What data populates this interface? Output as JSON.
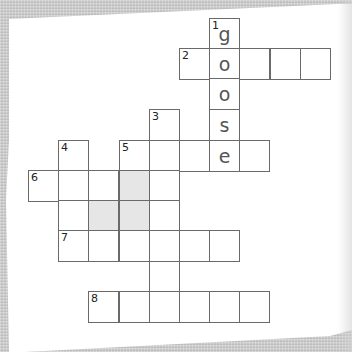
{
  "puzzle": {
    "type": "crossword",
    "cell_size_px": 30.2,
    "origin_px": {
      "x": 29,
      "y": 19
    },
    "colors": {
      "background": "#cfcfcf",
      "paper": "#ffffff",
      "grid_line": "#6a6a6a",
      "shaded_cell": "#e6e6e6",
      "letter": "#555555"
    },
    "cells": [
      {
        "row": 0,
        "col": 6,
        "number": "1",
        "letter": "g"
      },
      {
        "row": 1,
        "col": 5,
        "number": "2",
        "letter": ""
      },
      {
        "row": 1,
        "col": 6,
        "number": "",
        "letter": "o"
      },
      {
        "row": 1,
        "col": 7,
        "number": "",
        "letter": ""
      },
      {
        "row": 1,
        "col": 8,
        "number": "",
        "letter": ""
      },
      {
        "row": 1,
        "col": 9,
        "number": "",
        "letter": ""
      },
      {
        "row": 2,
        "col": 6,
        "number": "",
        "letter": "o"
      },
      {
        "row": 3,
        "col": 4,
        "number": "3",
        "letter": ""
      },
      {
        "row": 3,
        "col": 6,
        "number": "",
        "letter": "s"
      },
      {
        "row": 4,
        "col": 1,
        "number": "4",
        "letter": ""
      },
      {
        "row": 4,
        "col": 3,
        "number": "5",
        "letter": ""
      },
      {
        "row": 4,
        "col": 4,
        "number": "",
        "letter": ""
      },
      {
        "row": 4,
        "col": 5,
        "number": "",
        "letter": ""
      },
      {
        "row": 4,
        "col": 6,
        "number": "",
        "letter": "e"
      },
      {
        "row": 4,
        "col": 7,
        "number": "",
        "letter": ""
      },
      {
        "row": 5,
        "col": 0,
        "number": "6",
        "letter": ""
      },
      {
        "row": 5,
        "col": 1,
        "number": "",
        "letter": ""
      },
      {
        "row": 5,
        "col": 2,
        "number": "",
        "letter": ""
      },
      {
        "row": 5,
        "col": 3,
        "number": "",
        "letter": "",
        "shaded": true
      },
      {
        "row": 5,
        "col": 4,
        "number": "",
        "letter": ""
      },
      {
        "row": 6,
        "col": 1,
        "number": "",
        "letter": ""
      },
      {
        "row": 6,
        "col": 2,
        "number": "",
        "letter": "",
        "shaded": true
      },
      {
        "row": 6,
        "col": 3,
        "number": "",
        "letter": "",
        "shaded": true
      },
      {
        "row": 6,
        "col": 4,
        "number": "",
        "letter": ""
      },
      {
        "row": 7,
        "col": 1,
        "number": "7",
        "letter": ""
      },
      {
        "row": 7,
        "col": 2,
        "number": "",
        "letter": ""
      },
      {
        "row": 7,
        "col": 3,
        "number": "",
        "letter": ""
      },
      {
        "row": 7,
        "col": 4,
        "number": "",
        "letter": ""
      },
      {
        "row": 7,
        "col": 5,
        "number": "",
        "letter": ""
      },
      {
        "row": 7,
        "col": 6,
        "number": "",
        "letter": ""
      },
      {
        "row": 8,
        "col": 4,
        "number": "",
        "letter": ""
      },
      {
        "row": 9,
        "col": 2,
        "number": "8",
        "letter": ""
      },
      {
        "row": 9,
        "col": 3,
        "number": "",
        "letter": ""
      },
      {
        "row": 9,
        "col": 4,
        "number": "",
        "letter": ""
      },
      {
        "row": 9,
        "col": 5,
        "number": "",
        "letter": ""
      },
      {
        "row": 9,
        "col": 6,
        "number": "",
        "letter": ""
      },
      {
        "row": 9,
        "col": 7,
        "number": "",
        "letter": ""
      }
    ],
    "filled_answer": {
      "clue": "1",
      "direction": "down",
      "text": "goose"
    }
  }
}
